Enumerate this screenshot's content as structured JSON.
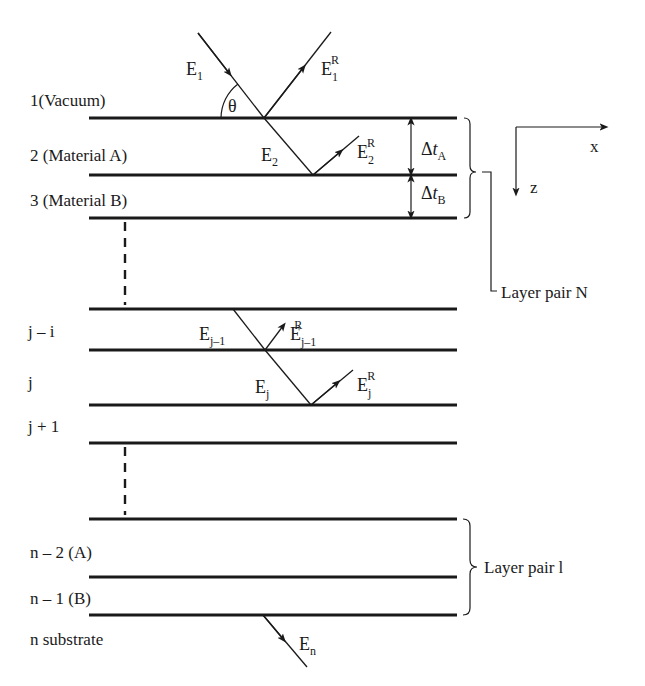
{
  "figure": {
    "type": "multilayer thin-film reflection diagram",
    "layers": [
      {
        "index": "1",
        "label": "1(Vacuum)"
      },
      {
        "index": "2",
        "label": "2 (Material  A)"
      },
      {
        "index": "3",
        "label": "3 (Material  B)"
      },
      {
        "index": "j-i",
        "label": "j – i"
      },
      {
        "index": "j",
        "label": "j"
      },
      {
        "index": "j+1",
        "label": "j + 1"
      },
      {
        "index": "n-2",
        "label": "n – 2 (A)"
      },
      {
        "index": "n-1",
        "label": "n – 1 (B)"
      },
      {
        "index": "n",
        "label": "n substrate"
      }
    ],
    "angle": {
      "symbol": "θ"
    },
    "fields": {
      "e1": {
        "base": "E",
        "sub": "1"
      },
      "e1r": {
        "base": "E",
        "sub": "1",
        "sup": "R"
      },
      "e2": {
        "base": "E",
        "sub": "2"
      },
      "e2r": {
        "base": "E",
        "sub": "2",
        "sup": "R"
      },
      "ejm1": {
        "base": "E",
        "sub": "j–1"
      },
      "ejm1r": {
        "base": "E",
        "sub": "j–1",
        "sup": "R"
      },
      "ej": {
        "base": "E",
        "sub": "j"
      },
      "ejr": {
        "base": "E",
        "sub": "j",
        "sup": "R"
      },
      "en": {
        "base": "E",
        "sub": "n"
      }
    },
    "thickness": {
      "a": {
        "base": "Δ",
        "var": "t",
        "sub": "A"
      },
      "b": {
        "base": "Δ",
        "var": "t",
        "sub": "B"
      }
    },
    "axes": {
      "x": "x",
      "z": "z"
    },
    "groups": {
      "top": "Layer pair N",
      "bottom": "Layer pair l"
    },
    "colors": {
      "ink": "#1a1a1a",
      "background": "#ffffff"
    }
  }
}
